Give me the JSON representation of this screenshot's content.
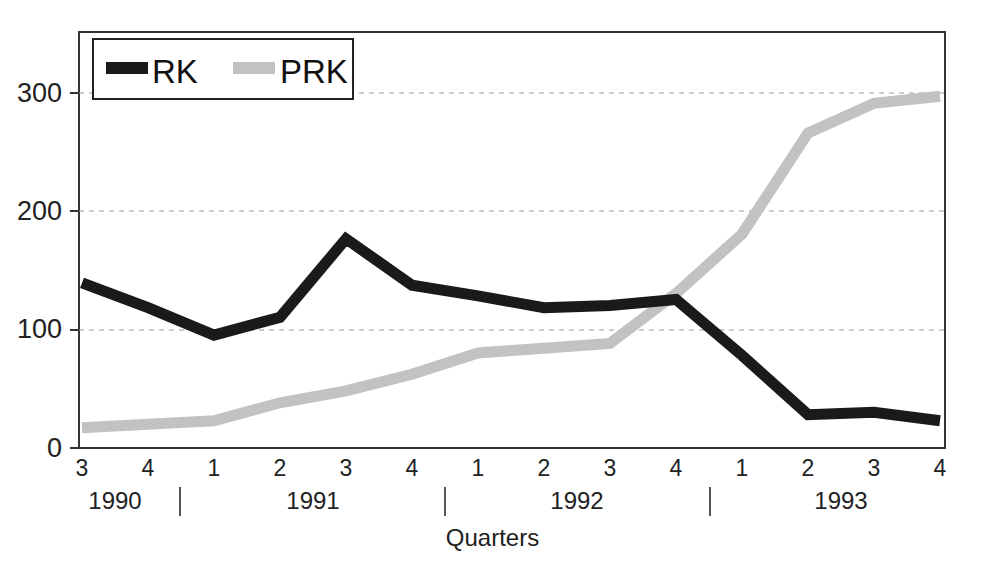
{
  "chart_data": {
    "type": "line",
    "title": "",
    "xlabel": "Quarters",
    "ylabel": "",
    "ylim": [
      0,
      350
    ],
    "yticks": [
      0,
      100,
      200,
      300
    ],
    "ytick_labels": [
      "0",
      "100",
      "200",
      "300"
    ],
    "grid": "horizontal-dashed",
    "legend_position": "top-left-inside",
    "x": [
      "1990 Q3",
      "1990 Q4",
      "1991 Q1",
      "1991 Q2",
      "1991 Q3",
      "1991 Q4",
      "1992 Q1",
      "1992 Q2",
      "1992 Q3",
      "1992 Q4",
      "1993 Q1",
      "1993 Q2",
      "1993 Q3",
      "1993 Q4"
    ],
    "xtick_labels": [
      "3",
      "4",
      "1",
      "2",
      "3",
      "4",
      "1",
      "2",
      "3",
      "4",
      "1",
      "2",
      "3",
      "4"
    ],
    "year_groups": [
      {
        "label": "1990",
        "start_index": 0,
        "end_index": 1
      },
      {
        "label": "1991",
        "start_index": 2,
        "end_index": 5
      },
      {
        "label": "1992",
        "start_index": 6,
        "end_index": 9
      },
      {
        "label": "1993",
        "start_index": 10,
        "end_index": 13
      }
    ],
    "series": [
      {
        "name": "RK",
        "color": "#1a1a1a",
        "values": [
          139,
          118,
          95,
          110,
          176,
          137,
          128,
          118,
          120,
          125,
          78,
          28,
          30,
          23
        ]
      },
      {
        "name": "PRK",
        "color": "#c2c2c2",
        "values": [
          17,
          20,
          23,
          38,
          48,
          62,
          80,
          84,
          88,
          130,
          180,
          265,
          290,
          296
        ]
      }
    ]
  },
  "legend": {
    "items": [
      {
        "label": "RK",
        "swatch": "black-thick-line"
      },
      {
        "label": "PRK",
        "swatch": "gray-thick-line"
      }
    ]
  },
  "axis": {
    "x_title": "Quarters",
    "ytick_labels": [
      "300",
      "200",
      "100",
      "0"
    ]
  }
}
